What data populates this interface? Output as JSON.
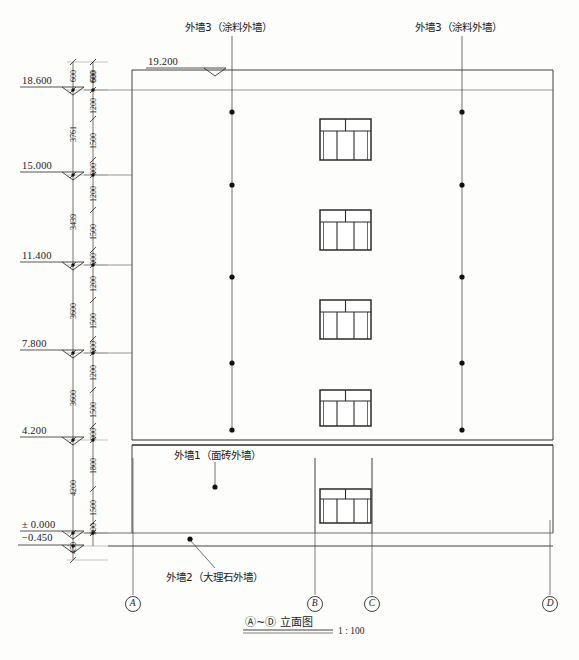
{
  "drawing": {
    "title_main": "Ⓐ~Ⓓ 立面图",
    "title_scale": "1 : 100",
    "sheet_type": "architectural-elevation"
  },
  "annotations": [
    {
      "id": "wall3-left",
      "label": "外墙3（涂料外墙）"
    },
    {
      "id": "wall3-right",
      "label": "外墙3（涂料外墙）"
    },
    {
      "id": "wall1",
      "label": "外墙1（面砖外墙）"
    },
    {
      "id": "wall2",
      "label": "外墙2（大理石外墙）"
    }
  ],
  "elevations": [
    {
      "value": "19.200",
      "y": 70,
      "flag": "down"
    },
    {
      "value": "18.600",
      "y": 90,
      "flag": "down"
    },
    {
      "value": "15.000",
      "y": 175,
      "flag": "down"
    },
    {
      "value": "11.400",
      "y": 265,
      "flag": "down"
    },
    {
      "value": "7.800",
      "y": 353,
      "flag": "down"
    },
    {
      "value": "4.200",
      "y": 440,
      "flag": "down"
    },
    {
      "value": "± 0.000",
      "y": 533,
      "flag": "down"
    },
    {
      "value": "−0.450",
      "y": 545,
      "flag": "down"
    }
  ],
  "dim_chain_outer": [
    {
      "text": "3761",
      "y_top": 90,
      "y_bot": 175
    },
    {
      "text": "3439",
      "y_top": 175,
      "y_bot": 265
    },
    {
      "text": "3600",
      "y_top": 265,
      "y_bot": 353
    },
    {
      "text": "3600",
      "y_top": 353,
      "y_bot": 440
    },
    {
      "text": "4200",
      "y_top": 440,
      "y_bot": 533
    },
    {
      "text": "450",
      "y_top": 533,
      "y_bot": 560
    }
  ],
  "dim_chain_inner": [
    {
      "text": "600",
      "y_top": 62,
      "y_bot": 90
    },
    {
      "text": "1200",
      "y_top": 90,
      "y_bot": 119
    },
    {
      "text": "1500",
      "y_top": 119,
      "y_bot": 160
    },
    {
      "text": "900",
      "y_top": 160,
      "y_bot": 175
    },
    {
      "text": "1200",
      "y_top": 175,
      "y_bot": 210
    },
    {
      "text": "1500",
      "y_top": 210,
      "y_bot": 250
    },
    {
      "text": "900",
      "y_top": 250,
      "y_bot": 265
    },
    {
      "text": "1200",
      "y_top": 265,
      "y_bot": 300
    },
    {
      "text": "1500",
      "y_top": 300,
      "y_bot": 339
    },
    {
      "text": "900",
      "y_top": 339,
      "y_bot": 353
    },
    {
      "text": "1200",
      "y_top": 353,
      "y_bot": 390
    },
    {
      "text": "1500",
      "y_top": 390,
      "y_bot": 426
    },
    {
      "text": "900",
      "y_top": 426,
      "y_bot": 440
    },
    {
      "text": "1800",
      "y_top": 440,
      "y_bot": 489
    },
    {
      "text": "1500",
      "y_top": 489,
      "y_bot": 523
    },
    {
      "text": "900",
      "y_top": 523,
      "y_bot": 533
    }
  ],
  "dim_chain_top": [
    {
      "text": "600",
      "x": 73
    },
    {
      "text": "600",
      "x": 93
    }
  ],
  "grid_axes": [
    {
      "label": "A",
      "x": 133
    },
    {
      "label": "B",
      "x": 315
    },
    {
      "label": "C",
      "x": 372
    },
    {
      "label": "D",
      "x": 550
    }
  ],
  "windows": [
    {
      "floor": "5F",
      "x": 320,
      "y": 119,
      "w": 51,
      "h": 41
    },
    {
      "floor": "4F",
      "x": 320,
      "y": 210,
      "w": 51,
      "h": 40
    },
    {
      "floor": "3F",
      "x": 320,
      "y": 300,
      "w": 51,
      "h": 39
    },
    {
      "floor": "2F",
      "x": 320,
      "y": 390,
      "w": 51,
      "h": 36
    },
    {
      "floor": "1F",
      "x": 320,
      "y": 489,
      "w": 51,
      "h": 34
    }
  ],
  "colors": {
    "line": "#2b2b2b",
    "thin_line": "#555555",
    "background": "#fdfdfb",
    "text": "#1a1a1a"
  }
}
